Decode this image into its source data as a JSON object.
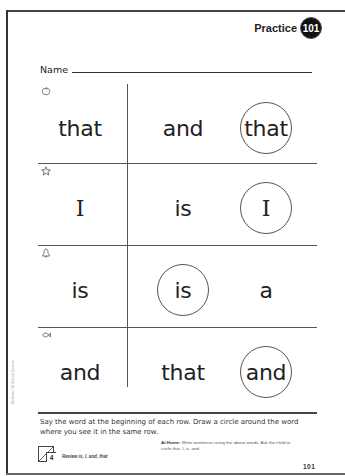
{
  "header": {
    "practice_label": "Practice",
    "practice_number": "101"
  },
  "name_field": {
    "label": "Name",
    "value": ""
  },
  "rows": [
    {
      "icon": "apple-icon",
      "target_word": "that",
      "choices": [
        "and",
        "that"
      ],
      "circled_index": 1
    },
    {
      "icon": "star-icon",
      "target_word": "I",
      "choices": [
        "is",
        "I"
      ],
      "circled_index": 1
    },
    {
      "icon": "bell-icon",
      "target_word": "is",
      "choices": [
        "is",
        "a"
      ],
      "circled_index": 0
    },
    {
      "icon": "fish-icon",
      "target_word": "and",
      "choices": [
        "that",
        "and"
      ],
      "circled_index": 1
    }
  ],
  "instructions": "Say the word at the beginning of each row. Draw a circle around the word where you see it in the same row.",
  "footer": {
    "review_number": "4",
    "review_text": "Review is, I, and, that",
    "at_home_label": "At Home:",
    "at_home_text": "Write sentences using the above words. Ask the child to circle that, I, is, and.",
    "page_number": "101",
    "side_credit": "McGraw-Hill School Division"
  }
}
